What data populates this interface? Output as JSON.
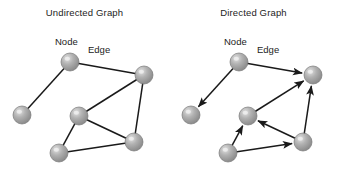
{
  "figure": {
    "background_color": "#ffffff",
    "width": 339,
    "height": 179
  },
  "style": {
    "node_fill_light": "#e2e2e2",
    "node_fill_mid": "#b2b2b2",
    "node_fill_dark": "#8a8a8a",
    "node_stroke": "#7a7a7a",
    "edge_color": "#1a1a1a",
    "text_color": "#232323",
    "node_radius": 9
  },
  "panels": [
    {
      "id": "undirected",
      "title": "Undirected Graph",
      "directed": false,
      "annotations": {
        "node_label": "Node",
        "edge_label": "Edge"
      },
      "nodes": [
        {
          "id": "n1",
          "label": "top",
          "x": 70,
          "y": 62
        },
        {
          "id": "n2",
          "label": "left",
          "x": 22,
          "y": 115
        },
        {
          "id": "n3",
          "label": "center",
          "x": 79,
          "y": 116
        },
        {
          "id": "n4",
          "label": "right-top",
          "x": 144,
          "y": 75
        },
        {
          "id": "n5",
          "label": "right-bottom",
          "x": 134,
          "y": 142
        },
        {
          "id": "n6",
          "label": "bottom",
          "x": 59,
          "y": 153
        }
      ],
      "edges": [
        {
          "from": "n1",
          "to": "n2"
        },
        {
          "from": "n1",
          "to": "n4"
        },
        {
          "from": "n4",
          "to": "n3"
        },
        {
          "from": "n4",
          "to": "n5"
        },
        {
          "from": "n3",
          "to": "n5"
        },
        {
          "from": "n3",
          "to": "n6"
        },
        {
          "from": "n6",
          "to": "n5"
        }
      ]
    },
    {
      "id": "directed",
      "title": "Directed Graph",
      "directed": true,
      "annotations": {
        "node_label": "Node",
        "edge_label": "Edge"
      },
      "nodes": [
        {
          "id": "n1",
          "label": "top",
          "x": 70,
          "y": 62
        },
        {
          "id": "n2",
          "label": "left",
          "x": 22,
          "y": 115
        },
        {
          "id": "n3",
          "label": "center",
          "x": 79,
          "y": 116
        },
        {
          "id": "n4",
          "label": "right-top",
          "x": 144,
          "y": 75
        },
        {
          "id": "n5",
          "label": "right-bottom",
          "x": 134,
          "y": 142
        },
        {
          "id": "n6",
          "label": "bottom",
          "x": 59,
          "y": 153
        }
      ],
      "edges": [
        {
          "from": "n1",
          "to": "n2"
        },
        {
          "from": "n1",
          "to": "n4"
        },
        {
          "from": "n3",
          "to": "n4"
        },
        {
          "from": "n5",
          "to": "n4"
        },
        {
          "from": "n5",
          "to": "n3"
        },
        {
          "from": "n6",
          "to": "n3"
        },
        {
          "from": "n6",
          "to": "n5"
        }
      ]
    }
  ]
}
